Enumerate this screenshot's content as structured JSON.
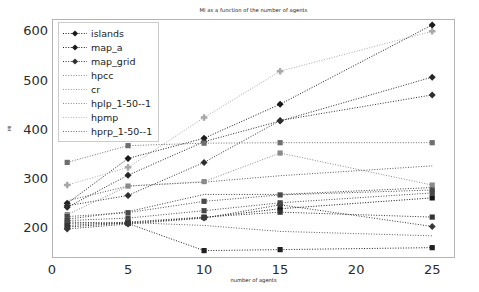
{
  "chart_data": {
    "type": "line",
    "title": "MI as a function of the number of agents",
    "xlabel": "number of agents",
    "ylabel": "MI",
    "x": [
      1,
      5,
      10,
      15,
      25
    ],
    "xlim": [
      0,
      26.5
    ],
    "ylim": [
      140,
      625
    ],
    "xticks": [
      0,
      5,
      10,
      15,
      20,
      25
    ],
    "yticks": [
      200,
      300,
      400,
      500,
      600
    ],
    "grid": false,
    "legend_position": "upper left",
    "series": [
      {
        "name": "islands",
        "marker": "square",
        "color": "#141414",
        "values": [
          203,
          211,
          222,
          240,
          262
        ]
      },
      {
        "name": "map_a",
        "marker": "diamond",
        "color": "#1a1a1a",
        "values": [
          251,
          342,
          383,
          452,
          613
        ]
      },
      {
        "name": "map_grid",
        "marker": "diamond",
        "color": "#262626",
        "values": [
          243,
          308,
          376,
          418,
          507
        ]
      },
      {
        "name": "hpcc",
        "marker": "square",
        "color": "#6e6e6e",
        "values": [
          334,
          368,
          373,
          374,
          374
        ]
      },
      {
        "name": "cr",
        "marker": "circle",
        "color": "#585858",
        "values": [
          256,
          286,
          294,
          307,
          327
        ]
      },
      {
        "name": "hplp_1-50--1",
        "marker": "circle",
        "color": "#3d3d3d",
        "values": [
          219,
          234,
          269,
          269,
          283
        ]
      },
      {
        "name": "hpmp",
        "marker": "plus",
        "color": "#a8a8a8",
        "values": [
          288,
          324,
          425,
          519,
          600
        ]
      },
      {
        "name": "hprp_1-50--1",
        "marker": "square",
        "color": "#202020",
        "values": [
          213,
          210,
          155,
          157,
          161
        ]
      },
      {
        "name": "extra_a",
        "marker": "diamond",
        "color": "#2e2e2e",
        "values": [
          246,
          267,
          334,
          419,
          471
        ]
      },
      {
        "name": "extra_b",
        "marker": "square",
        "color": "#8a8a8a",
        "values": [
          228,
          286,
          295,
          353,
          288
        ]
      },
      {
        "name": "extra_c",
        "marker": "square",
        "color": "#4a4a4a",
        "values": [
          224,
          232,
          255,
          268,
          278
        ]
      },
      {
        "name": "extra_d",
        "marker": "circle",
        "color": "#5c5c5c",
        "values": [
          210,
          212,
          206,
          194,
          185
        ]
      },
      {
        "name": "extra_e",
        "marker": "square",
        "color": "#333333",
        "values": [
          206,
          213,
          223,
          233,
          223
        ]
      },
      {
        "name": "extra_f",
        "marker": "diamond",
        "color": "#383838",
        "values": [
          199,
          209,
          221,
          248,
          204
        ]
      },
      {
        "name": "extra_g",
        "marker": "square",
        "color": "#464646",
        "values": [
          216,
          221,
          236,
          252,
          272
        ]
      }
    ],
    "legend_entries": [
      {
        "label": "islands",
        "marker": "diamond",
        "color": "#1a1a1a"
      },
      {
        "label": "map_a",
        "marker": "diamond",
        "color": "#1a1a1a"
      },
      {
        "label": "map_grid",
        "marker": "diamond",
        "color": "#303030"
      },
      {
        "label": "hpcc",
        "marker": "none",
        "color": "#8a8a8a"
      },
      {
        "label": "cr",
        "marker": "none",
        "color": "#9a9a9a"
      },
      {
        "label": "hplp_1-50--1",
        "marker": "none",
        "color": "#8a8a8a"
      },
      {
        "label": "hpmp",
        "marker": "none",
        "color": "#b4b4b4"
      },
      {
        "label": "hprp_1-50--1",
        "marker": "none",
        "color": "#6a6a6a"
      }
    ]
  },
  "axes": {
    "xtick_labels": [
      "0",
      "5",
      "10",
      "15",
      "20",
      "25"
    ],
    "ytick_labels": [
      "200",
      "300",
      "400",
      "500",
      "600"
    ]
  }
}
